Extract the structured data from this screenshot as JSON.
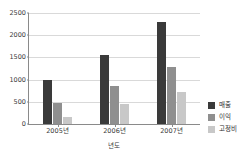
{
  "chart_data": {
    "type": "bar",
    "title": "",
    "xlabel": "년도",
    "ylabel": "",
    "categories": [
      "2005년",
      "2006년",
      "2007년"
    ],
    "series": [
      {
        "name": "매출",
        "color": "#3a3a3a",
        "values": [
          1000,
          1560,
          2300
        ]
      },
      {
        "name": "이익",
        "color": "#8f8f8f",
        "values": [
          480,
          860,
          1280
        ]
      },
      {
        "name": "고정비",
        "color": "#c8c8c8",
        "values": [
          150,
          440,
          720
        ]
      }
    ],
    "ylim": [
      0,
      2500
    ],
    "yticks": [
      0,
      500,
      1000,
      1500,
      2000,
      2500
    ],
    "ytick_labels": [
      "0",
      "500",
      "1000",
      "1500",
      "2000",
      "2500"
    ],
    "grid": true,
    "legend_position": "right"
  }
}
